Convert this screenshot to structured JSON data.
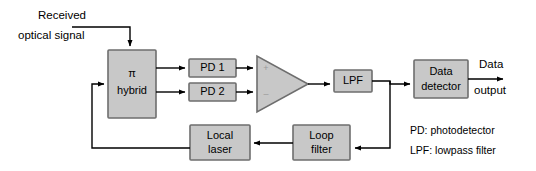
{
  "figure": {
    "type": "block-diagram"
  },
  "blocks": {
    "hybrid": {
      "line1": "π",
      "line2": "hybrid",
      "name": "pi-hybrid"
    },
    "pd1": {
      "label": "PD 1",
      "name": "photodetector-1"
    },
    "pd2": {
      "label": "PD 2",
      "name": "photodetector-2"
    },
    "amplifier": {
      "plus": "+",
      "minus": "–",
      "name": "differential-amplifier"
    },
    "lpf": {
      "label": "LPF",
      "name": "lowpass-filter"
    },
    "data_detector": {
      "line1": "Data",
      "line2": "detector",
      "name": "data-detector"
    },
    "loop_filter": {
      "line1": "Loop",
      "line2": "filter",
      "name": "loop-filter"
    },
    "local_laser": {
      "line1": "Local",
      "line2": "laser",
      "name": "local-laser"
    }
  },
  "labels": {
    "input_line1": "Received",
    "input_line2": "optical signal",
    "output_line1": "Data",
    "output_line2": "output"
  },
  "legend": {
    "line1": "PD: photodetector",
    "line2": "LPF: lowpass filter"
  },
  "colors": {
    "block_fill": "#c8c8c8",
    "block_stroke": "#6e6e6e",
    "wire": "#000000",
    "background": "#ffffff",
    "text": "#000000"
  }
}
